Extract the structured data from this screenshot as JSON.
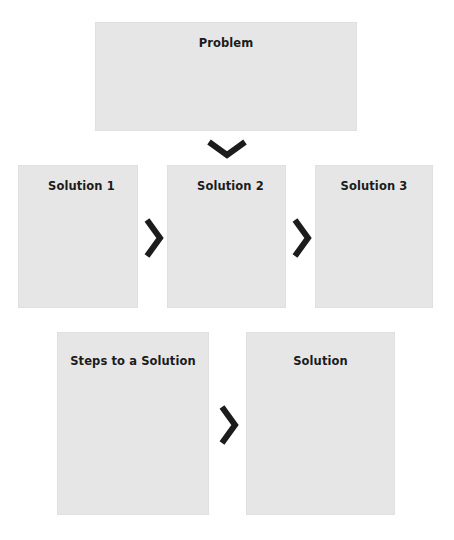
{
  "diagram": {
    "type": "flow",
    "colors": {
      "box_fill": "#e6e6e6",
      "text": "#1c1c1c",
      "arrow": "#1c1c1c",
      "background": "#ffffff"
    },
    "nodes": {
      "problem": {
        "label": "Problem"
      },
      "solution_1": {
        "label": "Solution 1"
      },
      "solution_2": {
        "label": "Solution 2"
      },
      "solution_3": {
        "label": "Solution 3"
      },
      "steps": {
        "label": "Steps to a Solution"
      },
      "solution": {
        "label": "Solution"
      }
    },
    "edges": [
      {
        "from": "problem",
        "to": "solution_2",
        "icon": "chevron-down-icon"
      },
      {
        "from": "solution_1",
        "to": "solution_2",
        "icon": "chevron-right-icon"
      },
      {
        "from": "solution_2",
        "to": "solution_3",
        "icon": "chevron-right-icon"
      },
      {
        "from": "steps",
        "to": "solution",
        "icon": "chevron-right-icon"
      }
    ]
  }
}
